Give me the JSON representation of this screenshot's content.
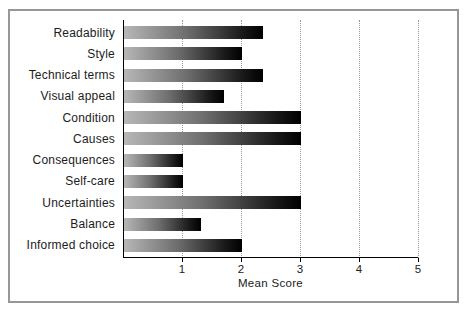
{
  "chart_data": {
    "type": "bar",
    "orientation": "horizontal",
    "title": "",
    "xlabel": "Mean Score",
    "categories": [
      "Readability",
      "Style",
      "Technical terms",
      "Visual appeal",
      "Condition",
      "Causes",
      "Consequences",
      "Self-care",
      "Uncertainties",
      "Balance",
      "Informed choice"
    ],
    "values": [
      2.35,
      2.0,
      2.35,
      1.7,
      3.0,
      3.0,
      1.0,
      1.0,
      3.0,
      1.3,
      2.0
    ],
    "xticks": [
      "1",
      "2",
      "3",
      "4",
      "5"
    ],
    "xlim": [
      0,
      5
    ],
    "grid": "vertical-dotted",
    "legend": "none",
    "colors": {
      "bar_gradient_start": "#b7b7b7",
      "bar_gradient_end": "#000000",
      "axis": "#000000",
      "gridline": "#9a9a9a",
      "frame_border": "#979797",
      "text": "#1c1c1c",
      "background": "#ffffff"
    }
  }
}
